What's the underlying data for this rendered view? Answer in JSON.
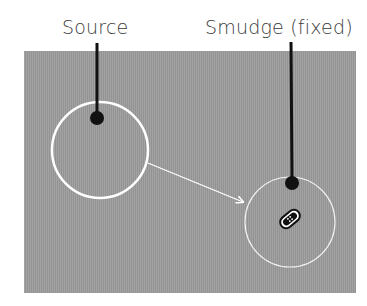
{
  "labels": {
    "source": "Source",
    "smudge": "Smudge (fixed)"
  },
  "colors": {
    "panel": "#9c9c9c",
    "circle_stroke": "#ffffff",
    "callout": "#111111",
    "text": "#3a3a3a"
  },
  "diagram": {
    "source_circle": {
      "cx": 100,
      "cy": 150,
      "r": 48
    },
    "smudge_circle": {
      "cx": 290,
      "cy": 222,
      "r": 45
    },
    "arrow": {
      "from": [
        148,
        163
      ],
      "to": [
        243,
        202
      ]
    },
    "icons": [
      "bandage-icon"
    ]
  }
}
